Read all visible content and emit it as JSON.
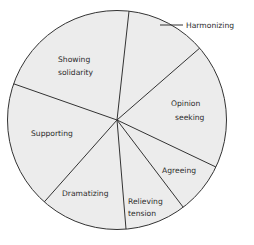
{
  "chart_data": {
    "type": "pie",
    "title": "",
    "start_angle_deg": 6.3,
    "direction": "clockwise",
    "slices": [
      {
        "label": "Harmonizing",
        "degrees": 42.7,
        "percent": 12
      },
      {
        "label": "Opinion seeking",
        "degrees": 66.4,
        "percent": 18
      },
      {
        "label": "Agreeing",
        "degrees": 27.4,
        "percent": 8
      },
      {
        "label": "Relieving tension",
        "degrees": 32.5,
        "percent": 9
      },
      {
        "label": "Dramatizing",
        "degrees": 46.3,
        "percent": 13
      },
      {
        "label": "Supporting",
        "degrees": 67.7,
        "percent": 19
      },
      {
        "label": "Showing solidarity",
        "degrees": 77.0,
        "percent": 21
      }
    ],
    "legend": "none",
    "fill_color": "#ececec",
    "line_color": "#333333"
  },
  "labels": {
    "harmonizing": "Harmonizing",
    "opinion_1": "Opinion",
    "opinion_2": "seeking",
    "agreeing": "Agreeing",
    "relieving_1": "Relieving",
    "relieving_2": "tension",
    "dramatizing": "Dramatizing",
    "supporting": "Supporting",
    "solidarity_1": "Showing",
    "solidarity_2": "solidarity"
  }
}
